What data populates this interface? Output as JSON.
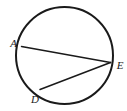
{
  "figure": {
    "kind": "circle-geometry-diagram",
    "canvas": {
      "width": 127,
      "height": 111,
      "background": "#ffffff"
    },
    "stroke_color": "#1a1a1a",
    "label_color": "#1a1a1a",
    "circle": {
      "cx": 64.5,
      "cy": 55.5,
      "r": 48.5,
      "stroke_width": 2
    },
    "points": [
      {
        "id": "A",
        "label": "A",
        "x": 21.5,
        "y": 46.5,
        "label_x": 13.5,
        "label_y": 46.5
      },
      {
        "id": "E",
        "label": "E",
        "x": 110.5,
        "y": 62.5,
        "label_x": 120.0,
        "label_y": 68.5
      },
      {
        "id": "D",
        "label": "D",
        "x": 40.0,
        "y": 89.5,
        "label_x": 35.0,
        "label_y": 102.5
      }
    ],
    "chords": [
      {
        "id": "AE",
        "from": "A",
        "to": "E",
        "x1": 21.5,
        "y1": 46.5,
        "x2": 110.5,
        "y2": 62.5,
        "stroke_width": 1.5
      },
      {
        "id": "DE",
        "from": "D",
        "to": "E",
        "x1": 40.0,
        "y1": 89.5,
        "x2": 110.5,
        "y2": 62.5,
        "stroke_width": 1.5
      }
    ]
  }
}
